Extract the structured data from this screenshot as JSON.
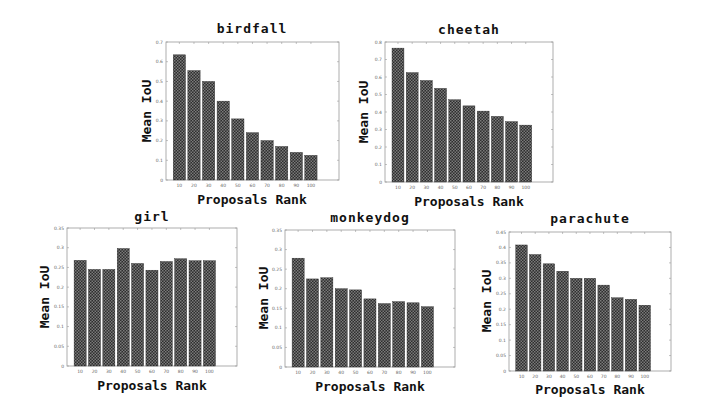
{
  "chart_data": [
    {
      "id": "birdfall",
      "type": "bar",
      "title": "birdfall",
      "xlabel": "Proposals Rank",
      "ylabel": "Mean IoU",
      "categories": [
        "10",
        "20",
        "30",
        "40",
        "50",
        "60",
        "70",
        "80",
        "90",
        "100"
      ],
      "values": [
        0.635,
        0.555,
        0.5,
        0.4,
        0.31,
        0.24,
        0.2,
        0.17,
        0.14,
        0.125
      ],
      "ylim": [
        0,
        0.7
      ],
      "yticks": [
        0,
        0.1,
        0.2,
        0.3,
        0.4,
        0.5,
        0.6,
        0.7
      ],
      "ytick_labels": [
        "0",
        "0.1",
        "0.2",
        "0.3",
        "0.4",
        "0.5",
        "0.6",
        "0.7"
      ],
      "grid": false
    },
    {
      "id": "cheetah",
      "type": "bar",
      "title": "cheetah",
      "xlabel": "Proposals Rank",
      "ylabel": "Mean IoU",
      "categories": [
        "10",
        "20",
        "30",
        "40",
        "50",
        "60",
        "70",
        "80",
        "90",
        "100"
      ],
      "values": [
        0.765,
        0.625,
        0.58,
        0.535,
        0.47,
        0.435,
        0.405,
        0.375,
        0.345,
        0.325
      ],
      "ylim": [
        0,
        0.8
      ],
      "yticks": [
        0,
        0.1,
        0.2,
        0.3,
        0.4,
        0.5,
        0.6,
        0.7,
        0.8
      ],
      "ytick_labels": [
        "0",
        "0.1",
        "0.2",
        "0.3",
        "0.4",
        "0.5",
        "0.6",
        "0.7",
        "0.8"
      ],
      "grid": false
    },
    {
      "id": "girl",
      "type": "bar",
      "title": "girl",
      "xlabel": "Proposals Rank",
      "ylabel": "Mean IoU",
      "categories": [
        "10",
        "20",
        "30",
        "40",
        "50",
        "60",
        "70",
        "80",
        "90",
        "100"
      ],
      "values": [
        0.268,
        0.245,
        0.245,
        0.298,
        0.26,
        0.243,
        0.265,
        0.272,
        0.267,
        0.267
      ],
      "ylim": [
        0,
        0.35
      ],
      "yticks": [
        0,
        0.05,
        0.1,
        0.15,
        0.2,
        0.25,
        0.3,
        0.35
      ],
      "ytick_labels": [
        "0",
        "0.05",
        "0.1",
        "0.15",
        "0.2",
        "0.25",
        "0.3",
        "0.35"
      ],
      "grid": false
    },
    {
      "id": "monkeydog",
      "type": "bar",
      "title": "monkeydog",
      "xlabel": "Proposals Rank",
      "ylabel": "Mean IoU",
      "categories": [
        "10",
        "20",
        "30",
        "40",
        "50",
        "60",
        "70",
        "80",
        "90",
        "100"
      ],
      "values": [
        0.278,
        0.225,
        0.228,
        0.2,
        0.197,
        0.174,
        0.162,
        0.167,
        0.164,
        0.154
      ],
      "ylim": [
        0,
        0.35
      ],
      "yticks": [
        0,
        0.05,
        0.1,
        0.15,
        0.2,
        0.25,
        0.3,
        0.35
      ],
      "ytick_labels": [
        "0",
        "0.05",
        "0.1",
        "0.15",
        "0.2",
        "0.25",
        "0.3",
        "0.35"
      ],
      "grid": false
    },
    {
      "id": "parachute",
      "type": "bar",
      "title": "parachute",
      "xlabel": "Proposals Rank",
      "ylabel": "Mean IoU",
      "categories": [
        "10",
        "20",
        "30",
        "40",
        "50",
        "60",
        "70",
        "80",
        "90",
        "100"
      ],
      "values": [
        0.408,
        0.377,
        0.347,
        0.323,
        0.3,
        0.3,
        0.278,
        0.237,
        0.232,
        0.213
      ],
      "ylim": [
        0,
        0.45
      ],
      "yticks": [
        0,
        0.05,
        0.1,
        0.15,
        0.2,
        0.25,
        0.3,
        0.35,
        0.4,
        0.45
      ],
      "ytick_labels": [
        "0",
        "0.05",
        "0.1",
        "0.15",
        "0.2",
        "0.25",
        "0.3",
        "0.35",
        "0.4",
        "0.45"
      ],
      "grid": false
    }
  ],
  "colors": {
    "bar_dark": "#2e2e2e",
    "bar_light": "#7a7a7a",
    "frame": "#9a9a9a"
  }
}
